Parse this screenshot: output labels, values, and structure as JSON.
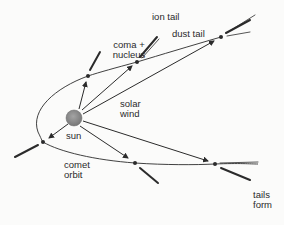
{
  "diagram": {
    "labels": {
      "ion_tail": "ion tail",
      "dust_tail": "dust tail",
      "coma_line1": "coma +",
      "coma_line2": "nucleus",
      "solar_line1": "solar",
      "solar_line2": "wind",
      "sun": "sun",
      "comet_line1": "comet",
      "comet_line2": "orbit",
      "tails_line1": "tails",
      "tails_line2": "form"
    },
    "colors": {
      "line": "#2b2b2b",
      "sun_fill": "#8a8a8a",
      "sun_edge": "#6f6f6f",
      "text": "#2a2a2a",
      "background": "#fbfbfa"
    },
    "nodes": [
      {
        "id": "sun",
        "type": "sun",
        "x": 74,
        "y": 118,
        "r": 8
      },
      {
        "id": "comet-1",
        "type": "comet",
        "x": 88,
        "y": 76
      },
      {
        "id": "comet-2",
        "type": "comet",
        "x": 137,
        "y": 62
      },
      {
        "id": "comet-3",
        "type": "comet",
        "x": 221,
        "y": 37
      },
      {
        "id": "comet-4",
        "type": "comet",
        "x": 43,
        "y": 142
      },
      {
        "id": "comet-5",
        "type": "comet",
        "x": 135,
        "y": 163
      },
      {
        "id": "comet-6",
        "type": "comet",
        "x": 215,
        "y": 164
      }
    ],
    "edges": [
      {
        "from": "sun",
        "to": "comet-1",
        "label": "solar wind"
      },
      {
        "from": "sun",
        "to": "comet-2",
        "label": "solar wind"
      },
      {
        "from": "sun",
        "to": "comet-3",
        "label": "solar wind"
      },
      {
        "from": "sun",
        "to": "comet-4",
        "label": "solar wind"
      },
      {
        "from": "sun",
        "to": "comet-5",
        "label": "solar wind"
      },
      {
        "from": "sun",
        "to": "comet-6",
        "label": "solar wind"
      }
    ]
  }
}
